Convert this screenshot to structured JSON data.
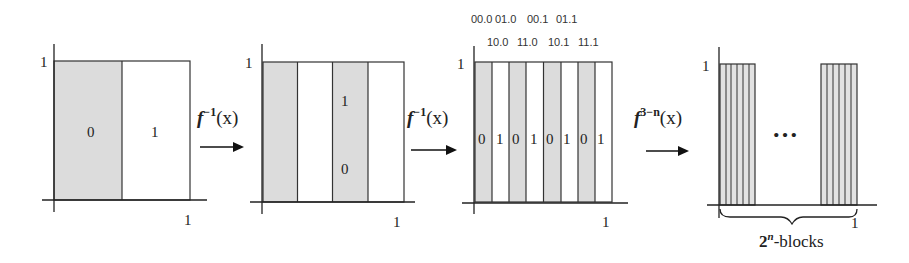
{
  "colors": {
    "shaded": "#dcdcdc",
    "unshaded": "#ffffff",
    "stroke": "#333333"
  },
  "panels": [
    {
      "id": "panel-1",
      "y_tick": "1",
      "x_tick": "1",
      "strips": [
        {
          "shaded": true,
          "label": "0"
        },
        {
          "shaded": false,
          "label": "1"
        }
      ]
    },
    {
      "id": "panel-2",
      "y_tick": "1",
      "x_tick": "1",
      "strips": [
        {
          "shaded": true,
          "label": ""
        },
        {
          "shaded": false,
          "label": ""
        },
        {
          "shaded": true,
          "label_top": "1",
          "label_bottom": "0"
        },
        {
          "shaded": false,
          "label": ""
        }
      ]
    },
    {
      "id": "panel-3",
      "y_tick": "1",
      "x_tick": "1",
      "header_row1": [
        "00.0",
        "01.0",
        "00.1",
        "01.1"
      ],
      "header_row2": [
        "10.0",
        "11.0",
        "10.1",
        "11.1"
      ],
      "strips": [
        {
          "shaded": true,
          "label": "0"
        },
        {
          "shaded": false,
          "label": "1"
        },
        {
          "shaded": true,
          "label": "0"
        },
        {
          "shaded": false,
          "label": "1"
        },
        {
          "shaded": true,
          "label": "0"
        },
        {
          "shaded": false,
          "label": "1"
        },
        {
          "shaded": true,
          "label": "0"
        },
        {
          "shaded": false,
          "label": "1"
        }
      ]
    },
    {
      "id": "panel-4",
      "y_tick": "1",
      "x_tick": "1",
      "ellipsis": "…",
      "brace_label_base": "2",
      "brace_label_exp": "n",
      "brace_label_suffix": "-blocks"
    }
  ],
  "arrows": [
    {
      "func": "f",
      "exp": "−1",
      "arg": "(x)"
    },
    {
      "func": "f",
      "exp": "−1",
      "arg": "(x)"
    },
    {
      "func": "f",
      "exp": "3−n",
      "arg": "(x)"
    }
  ]
}
